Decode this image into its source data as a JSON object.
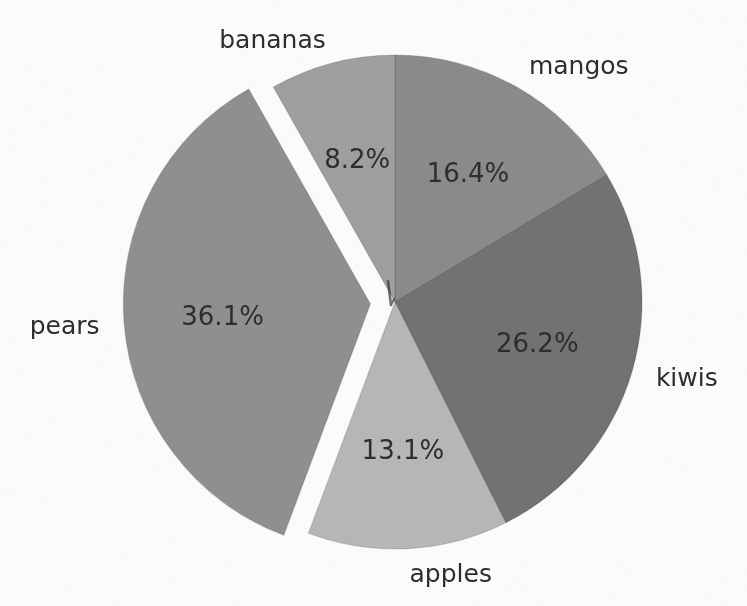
{
  "chart_data": {
    "type": "pie",
    "labels": [
      "mangos",
      "kiwis",
      "apples",
      "pears",
      "bananas"
    ],
    "values": [
      16.4,
      26.2,
      13.1,
      36.1,
      8.2
    ],
    "pct_labels": [
      "16.4%",
      "26.2%",
      "13.1%",
      "36.1%",
      "8.2%"
    ],
    "colors": [
      "#898989",
      "#6f6f6f",
      "#b6b6b6",
      "#8e8e8e",
      "#9e9e9e"
    ],
    "explode": [
      0,
      0,
      0,
      0.1,
      0
    ],
    "start_angle": 90,
    "clockwise": true,
    "center": [
      395,
      302
    ],
    "radius": 247,
    "label_radius_factor": 1.1,
    "pct_radius_factor": 0.6,
    "legend": "none",
    "title": "",
    "background": "#fcfcfc",
    "text_color": "#2a2a2a"
  }
}
